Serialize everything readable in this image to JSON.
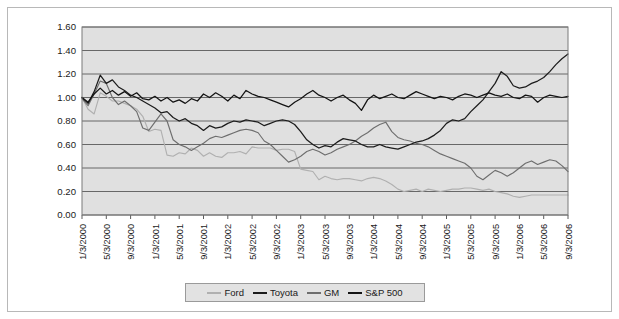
{
  "figure": {
    "background_color": "#ffffff",
    "frame_border_color": "#b8b8b8",
    "plot_background_color": "#e0e0e0",
    "plot_border_color": "#7a7a7a",
    "gridline_color": "#5a5a5a",
    "axis_label_color": "#1a1a1a"
  },
  "legend": {
    "position": "bottom-center",
    "background_color": "#e2e2e2",
    "border_color": "#9a9a9a",
    "entries": [
      {
        "label": "Ford",
        "color": "#b0b0b0"
      },
      {
        "label": "Toyota",
        "color": "#1c1c1c"
      },
      {
        "label": "GM",
        "color": "#6e6e6e"
      },
      {
        "label": "S&P 500",
        "color": "#141414"
      }
    ]
  },
  "chart_data": {
    "type": "line",
    "title": "",
    "subtitle": "",
    "xlabel": "",
    "ylabel": "",
    "ylim": [
      0.0,
      1.6
    ],
    "yticks": [
      0.0,
      0.2,
      0.4,
      0.6,
      0.8,
      1.0,
      1.2,
      1.4,
      1.6
    ],
    "ytick_labels": [
      "0.00",
      "0.20",
      "0.40",
      "0.60",
      "0.80",
      "1.00",
      "1.20",
      "1.40",
      "1.60"
    ],
    "grid": true,
    "grid_axis": "y",
    "legend_position": "bottom",
    "x_tick_labels": [
      "1/3/2000",
      "5/3/2000",
      "9/3/2000",
      "1/3/2001",
      "5/3/2001",
      "9/3/2001",
      "1/3/2002",
      "5/3/2002",
      "9/3/2002",
      "1/3/2003",
      "5/3/2003",
      "9/3/2003",
      "1/3/2004",
      "5/3/2004",
      "9/3/2004",
      "1/3/2005",
      "5/3/2005",
      "9/3/2005",
      "1/3/2006",
      "5/3/2006",
      "9/3/2006"
    ],
    "x_tick_label_rotation": 90,
    "x_tick_interval_months": 4,
    "x_points_total": 81,
    "x_point_interval_months": 1,
    "series": [
      {
        "name": "Ford",
        "color": "#b0b0b0",
        "values": [
          1.0,
          0.9,
          0.86,
          1.04,
          1.01,
          0.97,
          0.97,
          0.95,
          0.93,
          0.9,
          0.84,
          0.71,
          0.73,
          0.72,
          0.51,
          0.5,
          0.53,
          0.52,
          0.57,
          0.55,
          0.5,
          0.53,
          0.5,
          0.49,
          0.53,
          0.53,
          0.54,
          0.52,
          0.58,
          0.57,
          0.57,
          0.57,
          0.55,
          0.56,
          0.56,
          0.54,
          0.39,
          0.38,
          0.37,
          0.3,
          0.33,
          0.31,
          0.3,
          0.31,
          0.31,
          0.3,
          0.29,
          0.31,
          0.32,
          0.31,
          0.29,
          0.26,
          0.22,
          0.2,
          0.21,
          0.22,
          0.2,
          0.22,
          0.21,
          0.2,
          0.21,
          0.22,
          0.22,
          0.23,
          0.23,
          0.22,
          0.21,
          0.22,
          0.2,
          0.19,
          0.18,
          0.16,
          0.15,
          0.16,
          0.17,
          0.17,
          0.17,
          0.17,
          0.17,
          0.17,
          0.17
        ]
      },
      {
        "name": "Toyota",
        "color": "#1c1c1c",
        "values": [
          1.0,
          0.95,
          1.05,
          1.19,
          1.12,
          1.15,
          1.09,
          1.06,
          1.02,
          1.0,
          0.97,
          0.94,
          0.91,
          0.87,
          0.88,
          0.83,
          0.8,
          0.82,
          0.78,
          0.76,
          0.72,
          0.76,
          0.74,
          0.75,
          0.78,
          0.8,
          0.79,
          0.81,
          0.8,
          0.79,
          0.76,
          0.78,
          0.8,
          0.81,
          0.8,
          0.77,
          0.71,
          0.64,
          0.6,
          0.57,
          0.59,
          0.58,
          0.62,
          0.65,
          0.64,
          0.63,
          0.6,
          0.58,
          0.58,
          0.6,
          0.58,
          0.57,
          0.56,
          0.58,
          0.6,
          0.62,
          0.63,
          0.65,
          0.68,
          0.72,
          0.78,
          0.81,
          0.8,
          0.82,
          0.88,
          0.93,
          0.98,
          1.05,
          1.12,
          1.22,
          1.18,
          1.1,
          1.08,
          1.09,
          1.12,
          1.14,
          1.17,
          1.22,
          1.28,
          1.33,
          1.37
        ]
      },
      {
        "name": "GM",
        "color": "#6e6e6e",
        "values": [
          0.99,
          0.93,
          1.03,
          1.14,
          1.12,
          1.0,
          0.94,
          0.97,
          0.93,
          0.88,
          0.74,
          0.72,
          0.79,
          0.86,
          0.8,
          0.64,
          0.6,
          0.58,
          0.55,
          0.58,
          0.61,
          0.65,
          0.67,
          0.66,
          0.68,
          0.7,
          0.72,
          0.73,
          0.72,
          0.7,
          0.63,
          0.6,
          0.55,
          0.5,
          0.45,
          0.47,
          0.5,
          0.54,
          0.56,
          0.54,
          0.51,
          0.53,
          0.56,
          0.58,
          0.6,
          0.63,
          0.67,
          0.7,
          0.74,
          0.77,
          0.79,
          0.71,
          0.66,
          0.64,
          0.63,
          0.61,
          0.6,
          0.58,
          0.55,
          0.52,
          0.5,
          0.48,
          0.46,
          0.44,
          0.4,
          0.33,
          0.3,
          0.34,
          0.38,
          0.36,
          0.33,
          0.36,
          0.4,
          0.44,
          0.46,
          0.43,
          0.45,
          0.47,
          0.46,
          0.42,
          0.37
        ]
      },
      {
        "name": "S&P 500",
        "color": "#141414",
        "values": [
          1.0,
          0.96,
          1.03,
          1.08,
          1.03,
          1.06,
          1.02,
          1.05,
          1.01,
          1.04,
          0.99,
          0.98,
          1.01,
          0.97,
          1.0,
          0.96,
          0.98,
          0.95,
          0.99,
          0.97,
          1.03,
          1.0,
          1.04,
          1.01,
          0.97,
          1.02,
          0.99,
          1.06,
          1.03,
          1.01,
          1.0,
          0.98,
          0.96,
          0.94,
          0.92,
          0.96,
          0.99,
          1.03,
          1.06,
          1.02,
          1.0,
          0.97,
          1.0,
          1.02,
          0.98,
          0.95,
          0.89,
          0.98,
          1.02,
          0.99,
          1.01,
          1.03,
          1.0,
          0.99,
          1.02,
          1.05,
          1.03,
          1.01,
          0.99,
          1.01,
          1.0,
          0.98,
          1.01,
          1.03,
          1.02,
          1.0,
          1.02,
          1.04,
          1.02,
          1.01,
          1.03,
          1.0,
          0.99,
          1.02,
          1.01,
          0.96,
          1.0,
          1.02,
          1.01,
          1.0,
          1.01
        ]
      }
    ]
  }
}
